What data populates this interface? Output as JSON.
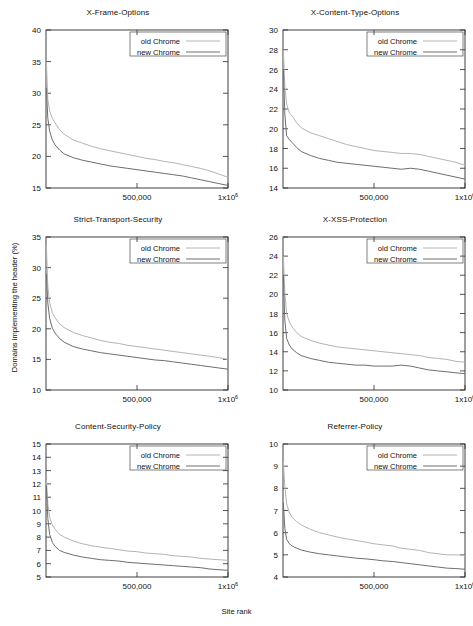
{
  "figure": {
    "xlabel": "Site rank",
    "ylabel": "Domains implementing the header (%)",
    "legend": {
      "old_label": "old  Chrome",
      "new_label": "new Chrome"
    },
    "colors": {
      "old": "#b4b4b4",
      "new": "#6e6e6e",
      "axis": "#2b2b2b",
      "background": "#ffffff"
    }
  },
  "chart_data": [
    {
      "type": "line",
      "title": "X-Frame-Options",
      "xlabel": "Site rank",
      "ylabel": "Domains implementing the header (%)",
      "xlim": [
        0,
        1000000
      ],
      "ylim": [
        15,
        40
      ],
      "yticks": [
        15,
        20,
        25,
        30,
        35,
        40
      ],
      "xticks": [
        500000,
        1000000
      ],
      "xticklabels": [
        "500,000",
        "1x10^6"
      ],
      "grid": false,
      "legend_position": "top-right",
      "x": [
        2000,
        10000,
        20000,
        35000,
        50000,
        75000,
        100000,
        150000,
        200000,
        250000,
        300000,
        350000,
        400000,
        450000,
        500000,
        550000,
        600000,
        650000,
        700000,
        750000,
        800000,
        850000,
        900000,
        950000,
        1000000
      ],
      "series": [
        {
          "name": "old  Chrome",
          "values": [
            35.0,
            29.0,
            27.2,
            26.0,
            25.3,
            24.2,
            23.5,
            22.6,
            22.1,
            21.6,
            21.2,
            20.9,
            20.6,
            20.3,
            20.0,
            19.7,
            19.5,
            19.2,
            19.0,
            18.7,
            18.4,
            18.1,
            17.7,
            17.2,
            16.7
          ]
        },
        {
          "name": "new Chrome",
          "values": [
            30.8,
            26.0,
            24.0,
            22.6,
            21.8,
            21.0,
            20.4,
            19.8,
            19.4,
            19.1,
            18.8,
            18.5,
            18.3,
            18.1,
            17.9,
            17.7,
            17.5,
            17.3,
            17.1,
            16.9,
            16.6,
            16.3,
            16.0,
            15.7,
            15.4
          ]
        }
      ]
    },
    {
      "type": "line",
      "title": "X-Content-Type-Options",
      "xlabel": "Site rank",
      "ylabel": "Domains implementing the header (%)",
      "xlim": [
        0,
        1000000
      ],
      "ylim": [
        14,
        30
      ],
      "yticks": [
        14,
        16,
        18,
        20,
        22,
        24,
        26,
        28,
        30
      ],
      "xticks": [
        500000,
        1000000
      ],
      "xticklabels": [
        "500,000",
        "1x10^6"
      ],
      "grid": false,
      "legend_position": "top-right",
      "x": [
        2000,
        10000,
        20000,
        35000,
        50000,
        75000,
        100000,
        150000,
        200000,
        250000,
        300000,
        350000,
        400000,
        450000,
        500000,
        550000,
        600000,
        650000,
        700000,
        750000,
        800000,
        850000,
        900000,
        950000,
        1000000
      ],
      "series": [
        {
          "name": "old  Chrome",
          "values": [
            28.0,
            24.3,
            22.5,
            21.6,
            21.3,
            20.6,
            20.1,
            19.6,
            19.3,
            19.0,
            18.7,
            18.4,
            18.2,
            18.0,
            17.8,
            17.7,
            17.6,
            17.5,
            17.5,
            17.4,
            17.2,
            17.0,
            16.8,
            16.6,
            16.3
          ]
        },
        {
          "name": "new Chrome",
          "values": [
            26.0,
            21.5,
            19.3,
            18.9,
            18.6,
            18.1,
            17.7,
            17.3,
            17.0,
            16.8,
            16.6,
            16.5,
            16.4,
            16.3,
            16.2,
            16.1,
            16.0,
            15.9,
            16.0,
            15.9,
            15.7,
            15.5,
            15.3,
            15.1,
            14.9
          ]
        }
      ]
    },
    {
      "type": "line",
      "title": "Strict-Transport-Security",
      "xlabel": "Site rank",
      "ylabel": "Domains implementing the header (%)",
      "xlim": [
        0,
        1000000
      ],
      "ylim": [
        10,
        35
      ],
      "yticks": [
        10,
        15,
        20,
        25,
        30,
        35
      ],
      "xticks": [
        500000,
        1000000
      ],
      "xticklabels": [
        "500,000",
        "1x10^6"
      ],
      "grid": false,
      "legend_position": "top-right",
      "x": [
        2000,
        10000,
        20000,
        35000,
        50000,
        75000,
        100000,
        150000,
        200000,
        250000,
        300000,
        350000,
        400000,
        450000,
        500000,
        550000,
        600000,
        650000,
        700000,
        750000,
        800000,
        850000,
        900000,
        950000,
        1000000
      ],
      "series": [
        {
          "name": "old  Chrome",
          "values": [
            33.7,
            27.0,
            24.3,
            22.6,
            21.8,
            20.8,
            20.2,
            19.4,
            18.9,
            18.5,
            18.1,
            17.8,
            17.6,
            17.3,
            17.1,
            16.9,
            16.7,
            16.5,
            16.3,
            16.1,
            15.9,
            15.7,
            15.5,
            15.3,
            15.0
          ]
        },
        {
          "name": "new Chrome",
          "values": [
            29.0,
            24.2,
            21.7,
            20.1,
            19.3,
            18.4,
            17.8,
            17.1,
            16.7,
            16.4,
            16.1,
            15.9,
            15.7,
            15.5,
            15.3,
            15.1,
            14.9,
            14.8,
            14.6,
            14.4,
            14.2,
            14.0,
            13.8,
            13.6,
            13.4
          ]
        }
      ]
    },
    {
      "type": "line",
      "title": "X-XSS-Protection",
      "xlabel": "Site rank",
      "ylabel": "Domains implementing the header (%)",
      "xlim": [
        0,
        1000000
      ],
      "ylim": [
        10,
        26
      ],
      "yticks": [
        10,
        12,
        14,
        16,
        18,
        20,
        22,
        24,
        26
      ],
      "xticks": [
        500000,
        1000000
      ],
      "xticklabels": [
        "500,000",
        "1x10^6"
      ],
      "grid": false,
      "legend_position": "top-right",
      "x": [
        2000,
        10000,
        20000,
        35000,
        50000,
        75000,
        100000,
        150000,
        200000,
        250000,
        300000,
        350000,
        400000,
        450000,
        500000,
        550000,
        600000,
        650000,
        700000,
        750000,
        800000,
        850000,
        900000,
        950000,
        1000000
      ],
      "series": [
        {
          "name": "old  Chrome",
          "values": [
            24.0,
            20.2,
            18.0,
            17.1,
            16.6,
            16.0,
            15.6,
            15.2,
            14.9,
            14.7,
            14.5,
            14.4,
            14.3,
            14.2,
            14.1,
            14.0,
            13.9,
            13.8,
            13.7,
            13.6,
            13.4,
            13.3,
            13.2,
            13.0,
            12.9
          ]
        },
        {
          "name": "new Chrome",
          "values": [
            22.1,
            17.3,
            15.4,
            14.7,
            14.3,
            13.9,
            13.6,
            13.3,
            13.1,
            12.9,
            12.8,
            12.7,
            12.6,
            12.6,
            12.5,
            12.5,
            12.5,
            12.6,
            12.5,
            12.3,
            12.1,
            12.0,
            11.9,
            11.8,
            11.7
          ]
        }
      ]
    },
    {
      "type": "line",
      "title": "Content-Security-Policy",
      "xlabel": "Site rank",
      "ylabel": "Domains implementing the header (%)",
      "xlim": [
        0,
        1000000
      ],
      "ylim": [
        5,
        15
      ],
      "yticks": [
        5,
        6,
        7,
        8,
        9,
        10,
        11,
        12,
        13,
        14,
        15
      ],
      "xticks": [
        500000,
        1000000
      ],
      "xticklabels": [
        "500,000",
        "1x10^6"
      ],
      "grid": false,
      "legend_position": "top-right",
      "x": [
        2000,
        10000,
        20000,
        35000,
        50000,
        75000,
        100000,
        150000,
        200000,
        250000,
        300000,
        350000,
        400000,
        450000,
        500000,
        550000,
        600000,
        650000,
        700000,
        750000,
        800000,
        850000,
        900000,
        950000,
        1000000
      ],
      "series": [
        {
          "name": "old  Chrome",
          "values": [
            12.3,
            10.5,
            9.5,
            8.9,
            8.6,
            8.2,
            8.0,
            7.7,
            7.5,
            7.35,
            7.25,
            7.15,
            7.05,
            6.95,
            6.9,
            6.8,
            6.75,
            6.7,
            6.6,
            6.55,
            6.5,
            6.4,
            6.35,
            6.3,
            6.25
          ]
        },
        {
          "name": "new Chrome",
          "values": [
            11.9,
            9.4,
            8.2,
            7.6,
            7.3,
            7.0,
            6.85,
            6.65,
            6.5,
            6.4,
            6.3,
            6.25,
            6.2,
            6.1,
            6.05,
            6.0,
            5.95,
            5.9,
            5.85,
            5.8,
            5.75,
            5.7,
            5.6,
            5.55,
            5.5
          ]
        }
      ]
    },
    {
      "type": "line",
      "title": "Referrer-Policy",
      "xlabel": "Site rank",
      "ylabel": "Domains implementing the header (%)",
      "xlim": [
        0,
        1000000
      ],
      "ylim": [
        4,
        10
      ],
      "yticks": [
        4,
        5,
        6,
        7,
        8,
        9,
        10
      ],
      "xticks": [
        500000,
        1000000
      ],
      "xticklabels": [
        "500,000",
        "1x10^6"
      ],
      "grid": false,
      "legend_position": "top-right",
      "x": [
        2000,
        10000,
        20000,
        35000,
        50000,
        75000,
        100000,
        150000,
        200000,
        250000,
        300000,
        350000,
        400000,
        450000,
        500000,
        550000,
        600000,
        650000,
        700000,
        750000,
        800000,
        850000,
        900000,
        950000,
        1000000
      ],
      "series": [
        {
          "name": "old  Chrome",
          "values": [
            9.2,
            8.1,
            7.3,
            6.9,
            6.7,
            6.5,
            6.35,
            6.15,
            6.0,
            5.9,
            5.8,
            5.72,
            5.65,
            5.58,
            5.5,
            5.45,
            5.4,
            5.3,
            5.25,
            5.2,
            5.1,
            5.05,
            5.0,
            5.0,
            4.98
          ]
        },
        {
          "name": "new Chrome",
          "values": [
            7.35,
            6.2,
            5.7,
            5.5,
            5.4,
            5.3,
            5.22,
            5.12,
            5.05,
            5.0,
            4.95,
            4.9,
            4.85,
            4.82,
            4.78,
            4.73,
            4.7,
            4.65,
            4.6,
            4.55,
            4.5,
            4.45,
            4.4,
            4.38,
            4.35
          ]
        }
      ]
    }
  ]
}
